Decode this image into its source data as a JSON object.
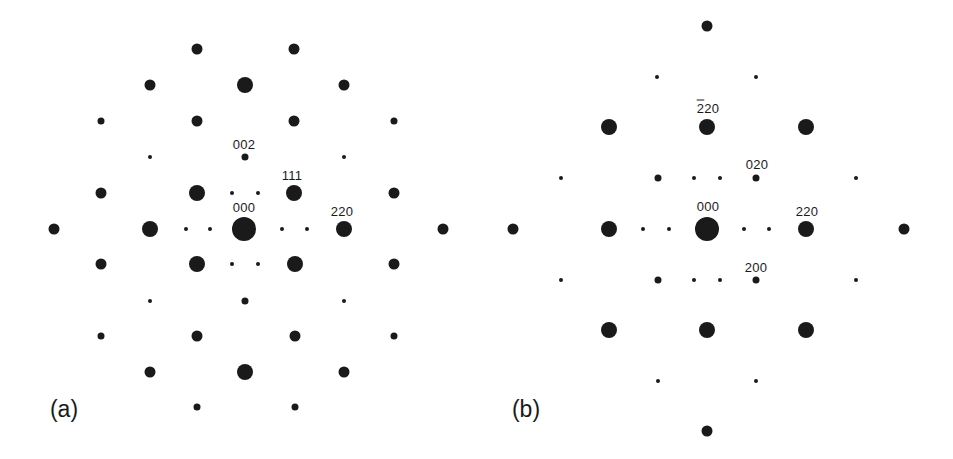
{
  "figure": {
    "spot_color": "#1a1a1a",
    "background": "#ffffff",
    "size_px": {
      "tiny": 4,
      "small": 7,
      "medium": 11,
      "large": 16,
      "center": 24
    }
  },
  "panels": [
    {
      "id": "a",
      "label": "(a)",
      "label_pos": [
        64,
        409
      ],
      "origin_px": [
        244,
        229
      ],
      "index_labels": [
        {
          "text": "002",
          "x": 244,
          "y": 144
        },
        {
          "text": "111",
          "x": 292,
          "y": 175
        },
        {
          "text": "000",
          "x": 244,
          "y": 207
        },
        {
          "text": "220",
          "x": 342,
          "y": 211
        }
      ],
      "spots": [
        [
          197,
          49,
          "medium"
        ],
        [
          294,
          49,
          "medium"
        ],
        [
          150,
          85,
          "medium"
        ],
        [
          245,
          85,
          "large"
        ],
        [
          344,
          85,
          "medium"
        ],
        [
          101,
          121,
          "small"
        ],
        [
          197,
          121,
          "medium"
        ],
        [
          294,
          121,
          "medium"
        ],
        [
          394,
          121,
          "small"
        ],
        [
          150,
          157,
          "tiny"
        ],
        [
          245,
          157,
          "small"
        ],
        [
          344,
          157,
          "tiny"
        ],
        [
          101,
          193,
          "medium"
        ],
        [
          197,
          193,
          "large"
        ],
        [
          232,
          193,
          "tiny"
        ],
        [
          258,
          193,
          "tiny"
        ],
        [
          294,
          193,
          "large"
        ],
        [
          394,
          193,
          "medium"
        ],
        [
          54,
          229,
          "medium"
        ],
        [
          150,
          229,
          "large"
        ],
        [
          186,
          229,
          "tiny"
        ],
        [
          210,
          229,
          "tiny"
        ],
        [
          244,
          229,
          "center"
        ],
        [
          282,
          229,
          "tiny"
        ],
        [
          307,
          229,
          "tiny"
        ],
        [
          344,
          229,
          "large"
        ],
        [
          443,
          229,
          "medium"
        ],
        [
          101,
          264,
          "medium"
        ],
        [
          197,
          264,
          "large"
        ],
        [
          232,
          264,
          "tiny"
        ],
        [
          258,
          264,
          "tiny"
        ],
        [
          295,
          264,
          "large"
        ],
        [
          394,
          264,
          "medium"
        ],
        [
          150,
          301,
          "tiny"
        ],
        [
          245,
          301,
          "small"
        ],
        [
          344,
          301,
          "tiny"
        ],
        [
          101,
          336,
          "small"
        ],
        [
          197,
          336,
          "medium"
        ],
        [
          295,
          336,
          "medium"
        ],
        [
          394,
          336,
          "small"
        ],
        [
          150,
          372,
          "medium"
        ],
        [
          245,
          372,
          "large"
        ],
        [
          344,
          372,
          "medium"
        ],
        [
          197,
          407,
          "small"
        ],
        [
          295,
          407,
          "small"
        ]
      ]
    },
    {
      "id": "b",
      "label": "(b)",
      "label_pos": [
        526,
        409
      ],
      "origin_px": [
        707,
        229
      ],
      "index_labels": [
        {
          "text": "220",
          "bar_chars": 1,
          "x": 708,
          "y": 108
        },
        {
          "text": "020",
          "x": 757,
          "y": 164
        },
        {
          "text": "000",
          "x": 708,
          "y": 206
        },
        {
          "text": "220",
          "x": 807,
          "y": 211
        },
        {
          "text": "200",
          "x": 756,
          "y": 267
        }
      ],
      "spots": [
        [
          707,
          26,
          "medium"
        ],
        [
          657,
          77,
          "tiny"
        ],
        [
          756,
          77,
          "tiny"
        ],
        [
          609,
          127,
          "large"
        ],
        [
          707,
          127,
          "large"
        ],
        [
          806,
          127,
          "large"
        ],
        [
          561,
          178,
          "tiny"
        ],
        [
          658,
          178,
          "small"
        ],
        [
          694,
          178,
          "tiny"
        ],
        [
          720,
          178,
          "tiny"
        ],
        [
          756,
          178,
          "small"
        ],
        [
          856,
          178,
          "tiny"
        ],
        [
          513,
          229,
          "medium"
        ],
        [
          609,
          229,
          "large"
        ],
        [
          643,
          229,
          "tiny"
        ],
        [
          669,
          229,
          "tiny"
        ],
        [
          707,
          229,
          "center"
        ],
        [
          744,
          229,
          "tiny"
        ],
        [
          769,
          229,
          "tiny"
        ],
        [
          806,
          229,
          "large"
        ],
        [
          904,
          229,
          "medium"
        ],
        [
          561,
          280,
          "tiny"
        ],
        [
          658,
          280,
          "small"
        ],
        [
          694,
          280,
          "tiny"
        ],
        [
          720,
          280,
          "tiny"
        ],
        [
          756,
          280,
          "small"
        ],
        [
          856,
          280,
          "tiny"
        ],
        [
          609,
          330,
          "large"
        ],
        [
          707,
          330,
          "large"
        ],
        [
          806,
          330,
          "large"
        ],
        [
          658,
          381,
          "tiny"
        ],
        [
          756,
          381,
          "tiny"
        ],
        [
          707,
          431,
          "medium"
        ]
      ]
    }
  ]
}
